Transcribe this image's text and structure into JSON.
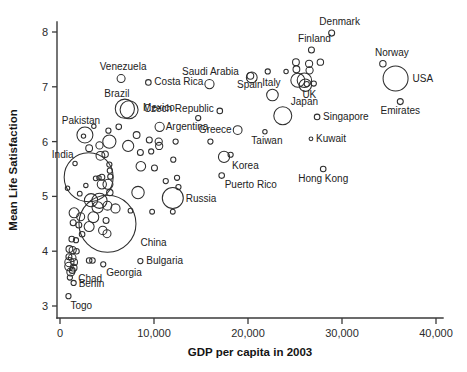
{
  "chart_data": {
    "type": "scatter",
    "title": "",
    "subtitle": "",
    "xlabel": "GDP per capita in 2003",
    "ylabel": "Mean Life Satisfaction",
    "xlim": [
      0,
      42500
    ],
    "ylim": [
      2.82,
      8.25
    ],
    "xticks": [
      0,
      10000,
      20000,
      30000,
      40000
    ],
    "xticklabels": [
      "0",
      "10,000",
      "20,000",
      "30,000",
      "40,000"
    ],
    "yticks": [
      3,
      4,
      5,
      6,
      7,
      8
    ],
    "yticklabels": [
      "3",
      "4",
      "5",
      "6",
      "7",
      "8"
    ],
    "grid": false,
    "legend": null,
    "bubble_encoding": "population (marker area)",
    "marker_style": "open circle, black outline, no fill",
    "note": "Bubble size encodes country population; r is in pixels as drawn.",
    "labeled_points": [
      {
        "label": "Denmark",
        "x": 28900,
        "y": 7.98,
        "r": 3.0,
        "label_dx": 8,
        "label_dy": -8,
        "anchor": "middle"
      },
      {
        "label": "Finland",
        "x": 26750,
        "y": 7.67,
        "r": 3.0,
        "label_dx": 3,
        "label_dy": -8,
        "anchor": "middle"
      },
      {
        "label": "Norway",
        "x": 34350,
        "y": 7.42,
        "r": 3.2,
        "label_dx": 9,
        "label_dy": -8,
        "anchor": "middle"
      },
      {
        "label": "USA",
        "x": 35700,
        "y": 7.15,
        "r": 12.5,
        "label_dx": 17,
        "label_dy": 3,
        "anchor": "start"
      },
      {
        "label": "Venezuela",
        "x": 6500,
        "y": 7.15,
        "r": 4.0,
        "label_dx": 2,
        "label_dy": -9,
        "anchor": "middle"
      },
      {
        "label": "Costa Rica",
        "x": 9400,
        "y": 7.08,
        "r": 2.8,
        "label_dx": 6,
        "label_dy": 3,
        "anchor": "start"
      },
      {
        "label": "Saudi Arabia",
        "x": 15900,
        "y": 7.05,
        "r": 4.6,
        "label_dx": 1,
        "label_dy": -9,
        "anchor": "middle"
      },
      {
        "label": "Spain",
        "x": 20400,
        "y": 7.17,
        "r": 5.4,
        "label_dx": -2,
        "label_dy": 11,
        "anchor": "middle"
      },
      {
        "label": "Italy",
        "x": 22600,
        "y": 6.85,
        "r": 5.8,
        "label_dx": -1,
        "label_dy": -9,
        "anchor": "middle"
      },
      {
        "label": "UK",
        "x": 26100,
        "y": 7.03,
        "r": 6.2,
        "label_dx": 4,
        "label_dy": 13,
        "anchor": "middle"
      },
      {
        "label": "Emirates",
        "x": 36200,
        "y": 6.73,
        "r": 3.0,
        "label_dx": 0,
        "label_dy": 12,
        "anchor": "middle"
      },
      {
        "label": "Brazil",
        "x": 6900,
        "y": 6.6,
        "r": 9.6,
        "label_dx": -8,
        "label_dy": -12,
        "anchor": "middle"
      },
      {
        "label": "Mexico",
        "x": 7350,
        "y": 6.58,
        "r": 9.0,
        "label_dx": 14,
        "label_dy": 1,
        "anchor": "start"
      },
      {
        "label": "Czech Republic",
        "x": 17000,
        "y": 6.56,
        "r": 2.8,
        "label_dx": -6,
        "label_dy": 1,
        "anchor": "end"
      },
      {
        "label": "Japan",
        "x": 23700,
        "y": 6.47,
        "r": 9.0,
        "label_dx": 8,
        "label_dy": -11,
        "anchor": "start"
      },
      {
        "label": "Singapore",
        "x": 27350,
        "y": 6.45,
        "r": 2.8,
        "label_dx": 6,
        "label_dy": 3,
        "anchor": "start"
      },
      {
        "label": "Pakistan",
        "x": 2650,
        "y": 6.12,
        "r": 8.0,
        "label_dx": -4,
        "label_dy": -11,
        "anchor": "middle"
      },
      {
        "label": "Argentina",
        "x": 10600,
        "y": 6.27,
        "r": 4.6,
        "label_dx": 6,
        "label_dy": 3,
        "anchor": "start"
      },
      {
        "label": "Greece",
        "x": 18900,
        "y": 6.21,
        "r": 4.4,
        "label_dx": -6,
        "label_dy": 3,
        "anchor": "end"
      },
      {
        "label": "Kuwait",
        "x": 26700,
        "y": 6.05,
        "r": 1.9,
        "label_dx": 5,
        "label_dy": 3,
        "anchor": "start"
      },
      {
        "label": "Taiwan",
        "x": 21800,
        "y": 6.18,
        "r": 2.2,
        "label_dx": 2,
        "label_dy": 12,
        "anchor": "middle"
      },
      {
        "label": "India",
        "x": 3050,
        "y": 5.35,
        "r": 24.5,
        "label_dx": -26,
        "label_dy": -19,
        "anchor": "middle"
      },
      {
        "label": "Korea",
        "x": 17450,
        "y": 5.72,
        "r": 5.6,
        "label_dx": 8,
        "label_dy": 12,
        "anchor": "start"
      },
      {
        "label": "Hong Kong",
        "x": 28000,
        "y": 5.5,
        "r": 2.8,
        "label_dx": 0,
        "label_dy": 13,
        "anchor": "middle"
      },
      {
        "label": "Puerto Rico",
        "x": 17200,
        "y": 5.38,
        "r": 2.8,
        "label_dx": 3,
        "label_dy": 12,
        "anchor": "start"
      },
      {
        "label": "Russia",
        "x": 12000,
        "y": 4.97,
        "r": 10.5,
        "label_dx": 13,
        "label_dy": 4,
        "anchor": "start"
      },
      {
        "label": "China",
        "x": 5050,
        "y": 4.5,
        "r": 28.5,
        "label_dx": 33,
        "label_dy": 22,
        "anchor": "start"
      },
      {
        "label": "Bulgaria",
        "x": 8550,
        "y": 3.82,
        "r": 2.6,
        "label_dx": 6,
        "label_dy": 3,
        "anchor": "start"
      },
      {
        "label": "Georgia",
        "x": 4600,
        "y": 3.76,
        "r": 2.6,
        "label_dx": 3,
        "label_dy": 12,
        "anchor": "start"
      },
      {
        "label": "Chad",
        "x": 1300,
        "y": 3.65,
        "r": 3.0,
        "label_dx": 6,
        "label_dy": 12,
        "anchor": "start"
      },
      {
        "label": "Benin",
        "x": 1450,
        "y": 3.42,
        "r": 2.6,
        "label_dx": 5,
        "label_dy": 4,
        "anchor": "start"
      },
      {
        "label": "Togo",
        "x": 900,
        "y": 3.18,
        "r": 2.6,
        "label_dx": 2,
        "label_dy": 13,
        "anchor": "start"
      }
    ],
    "unlabeled_points": [
      {
        "x": 25100,
        "y": 7.45,
        "r": 3.4
      },
      {
        "x": 25150,
        "y": 7.32,
        "r": 3.4
      },
      {
        "x": 26500,
        "y": 7.42,
        "r": 3.6
      },
      {
        "x": 26550,
        "y": 7.3,
        "r": 3.6
      },
      {
        "x": 27700,
        "y": 7.45,
        "r": 3.2
      },
      {
        "x": 22100,
        "y": 7.28,
        "r": 2.6
      },
      {
        "x": 25300,
        "y": 7.12,
        "r": 7.0
      },
      {
        "x": 26000,
        "y": 7.12,
        "r": 7.2
      },
      {
        "x": 26250,
        "y": 7.05,
        "r": 2.6
      },
      {
        "x": 27000,
        "y": 7.06,
        "r": 2.6
      },
      {
        "x": 24050,
        "y": 7.28,
        "r": 2.2
      },
      {
        "x": 20250,
        "y": 7.2,
        "r": 3.4
      },
      {
        "x": 14700,
        "y": 6.43,
        "r": 2.6
      },
      {
        "x": 6250,
        "y": 6.27,
        "r": 2.8
      },
      {
        "x": 5150,
        "y": 6.2,
        "r": 2.6
      },
      {
        "x": 8150,
        "y": 6.12,
        "r": 3.4
      },
      {
        "x": 5250,
        "y": 6.0,
        "r": 6.6
      },
      {
        "x": 4200,
        "y": 5.93,
        "r": 3.6
      },
      {
        "x": 7250,
        "y": 5.92,
        "r": 5.6
      },
      {
        "x": 9500,
        "y": 6.03,
        "r": 3.0
      },
      {
        "x": 10500,
        "y": 6.0,
        "r": 3.6
      },
      {
        "x": 10550,
        "y": 5.92,
        "r": 3.6
      },
      {
        "x": 12300,
        "y": 6.0,
        "r": 2.6
      },
      {
        "x": 16000,
        "y": 6.0,
        "r": 2.6
      },
      {
        "x": 3100,
        "y": 5.88,
        "r": 3.4
      },
      {
        "x": 4800,
        "y": 5.77,
        "r": 3.2
      },
      {
        "x": 4300,
        "y": 5.74,
        "r": 4.4
      },
      {
        "x": 8550,
        "y": 5.8,
        "r": 3.0
      },
      {
        "x": 9700,
        "y": 5.82,
        "r": 2.6
      },
      {
        "x": 18150,
        "y": 5.76,
        "r": 2.6
      },
      {
        "x": 5250,
        "y": 5.58,
        "r": 2.6
      },
      {
        "x": 5300,
        "y": 5.47,
        "r": 2.6
      },
      {
        "x": 5350,
        "y": 5.36,
        "r": 2.6
      },
      {
        "x": 8600,
        "y": 5.55,
        "r": 4.8
      },
      {
        "x": 12050,
        "y": 5.67,
        "r": 2.6
      },
      {
        "x": 10050,
        "y": 5.52,
        "r": 3.0
      },
      {
        "x": 4450,
        "y": 5.35,
        "r": 3.0
      },
      {
        "x": 3800,
        "y": 5.33,
        "r": 2.4
      },
      {
        "x": 4150,
        "y": 5.34,
        "r": 2.2
      },
      {
        "x": 2750,
        "y": 5.2,
        "r": 2.2
      },
      {
        "x": 11250,
        "y": 5.28,
        "r": 2.6
      },
      {
        "x": 12450,
        "y": 5.34,
        "r": 2.6
      },
      {
        "x": 12600,
        "y": 5.17,
        "r": 2.6
      },
      {
        "x": 4450,
        "y": 5.22,
        "r": 4.6
      },
      {
        "x": 5100,
        "y": 5.22,
        "r": 5.0
      },
      {
        "x": 5300,
        "y": 5.07,
        "r": 3.2
      },
      {
        "x": 8300,
        "y": 5.07,
        "r": 6.2
      },
      {
        "x": 2100,
        "y": 5.05,
        "r": 2.4
      },
      {
        "x": 3300,
        "y": 4.93,
        "r": 6.6
      },
      {
        "x": 4200,
        "y": 4.92,
        "r": 7.6
      },
      {
        "x": 4000,
        "y": 4.8,
        "r": 5.6
      },
      {
        "x": 5050,
        "y": 4.83,
        "r": 4.4
      },
      {
        "x": 5900,
        "y": 4.78,
        "r": 4.6
      },
      {
        "x": 7500,
        "y": 4.74,
        "r": 2.4
      },
      {
        "x": 9800,
        "y": 4.72,
        "r": 2.4
      },
      {
        "x": 12000,
        "y": 4.72,
        "r": 2.4
      },
      {
        "x": 1500,
        "y": 4.7,
        "r": 5.0
      },
      {
        "x": 2200,
        "y": 4.63,
        "r": 4.0
      },
      {
        "x": 3550,
        "y": 4.62,
        "r": 5.4
      },
      {
        "x": 4900,
        "y": 4.56,
        "r": 3.0
      },
      {
        "x": 1400,
        "y": 4.52,
        "r": 3.0
      },
      {
        "x": 2000,
        "y": 4.48,
        "r": 3.0
      },
      {
        "x": 3100,
        "y": 4.45,
        "r": 5.0
      },
      {
        "x": 4550,
        "y": 4.38,
        "r": 4.2
      },
      {
        "x": 2350,
        "y": 4.31,
        "r": 2.8
      },
      {
        "x": 5000,
        "y": 4.32,
        "r": 4.0
      },
      {
        "x": 1250,
        "y": 4.22,
        "r": 2.8
      },
      {
        "x": 1700,
        "y": 4.2,
        "r": 2.6
      },
      {
        "x": 1000,
        "y": 4.04,
        "r": 3.4
      },
      {
        "x": 1350,
        "y": 4.02,
        "r": 3.6
      },
      {
        "x": 1750,
        "y": 4.0,
        "r": 2.8
      },
      {
        "x": 950,
        "y": 3.9,
        "r": 3.0
      },
      {
        "x": 1300,
        "y": 3.88,
        "r": 3.8
      },
      {
        "x": 1000,
        "y": 3.8,
        "r": 4.6
      },
      {
        "x": 1500,
        "y": 3.8,
        "r": 3.4
      },
      {
        "x": 3100,
        "y": 3.83,
        "r": 2.8
      },
      {
        "x": 3450,
        "y": 3.83,
        "r": 2.8
      },
      {
        "x": 950,
        "y": 3.72,
        "r": 4.2
      },
      {
        "x": 1450,
        "y": 3.7,
        "r": 3.4
      },
      {
        "x": 1150,
        "y": 3.62,
        "r": 4.0
      },
      {
        "x": 1050,
        "y": 3.52,
        "r": 2.6
      },
      {
        "x": 2500,
        "y": 6.1,
        "r": 2.2
      },
      {
        "x": 3600,
        "y": 6.28,
        "r": 2.2
      },
      {
        "x": 1600,
        "y": 5.6,
        "r": 2.2
      },
      {
        "x": 800,
        "y": 5.15,
        "r": 2.2
      }
    ]
  }
}
